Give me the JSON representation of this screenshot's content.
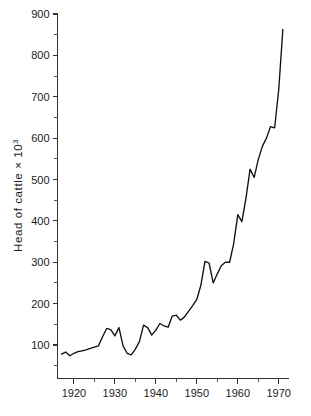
{
  "chart_data": {
    "type": "line",
    "title": "",
    "xlabel": "",
    "ylabel": "Head of cattle × 10³",
    "ylabel_base": "Head of cattle × 10",
    "ylabel_exponent": "3",
    "xlim": [
      1916.0,
      1972.5
    ],
    "ylim": [
      35,
      900
    ],
    "grid": false,
    "legend": null,
    "line_color": "#111111",
    "y_ticks_major": [
      100,
      200,
      300,
      400,
      500,
      600,
      700,
      800,
      900
    ],
    "y_ticks_major_labels": [
      "100",
      "200",
      "300",
      "400",
      "500",
      "600",
      "700",
      "800",
      "900"
    ],
    "y_ticks_minor": [
      50,
      150,
      250,
      350,
      450,
      550,
      650,
      750,
      850
    ],
    "x_ticks_major": [
      1920,
      1930,
      1940,
      1950,
      1960,
      1970
    ],
    "x_ticks_major_labels": [
      "1920",
      "1930",
      "1940",
      "1950",
      "1960",
      "1970"
    ],
    "x_ticks_minor": [
      1925,
      1935,
      1945,
      1955,
      1965
    ],
    "series": [
      {
        "name": "Head of cattle",
        "x": [
          1917,
          1918,
          1919,
          1920,
          1921,
          1922,
          1923,
          1924,
          1925,
          1926,
          1927,
          1928,
          1929,
          1930,
          1931,
          1932,
          1933,
          1934,
          1935,
          1936,
          1937,
          1938,
          1939,
          1940,
          1941,
          1942,
          1943,
          1944,
          1945,
          1946,
          1947,
          1948,
          1949,
          1950,
          1951,
          1952,
          1953,
          1954,
          1955,
          1956,
          1957,
          1958,
          1959,
          1960,
          1961,
          1962,
          1963,
          1964,
          1965,
          1966,
          1967,
          1968,
          1969,
          1970,
          1971
        ],
        "values": [
          78,
          83,
          74,
          80,
          84,
          86,
          88,
          92,
          95,
          98,
          120,
          140,
          137,
          122,
          142,
          98,
          80,
          76,
          90,
          108,
          148,
          142,
          124,
          136,
          152,
          146,
          143,
          170,
          172,
          160,
          168,
          182,
          195,
          210,
          245,
          302,
          298,
          250,
          272,
          292,
          300,
          300,
          345,
          415,
          398,
          455,
          525,
          505,
          548,
          580,
          600,
          628,
          625,
          718,
          863
        ]
      }
    ]
  },
  "axis": {
    "y_label": "Head of cattle × 10³"
  }
}
